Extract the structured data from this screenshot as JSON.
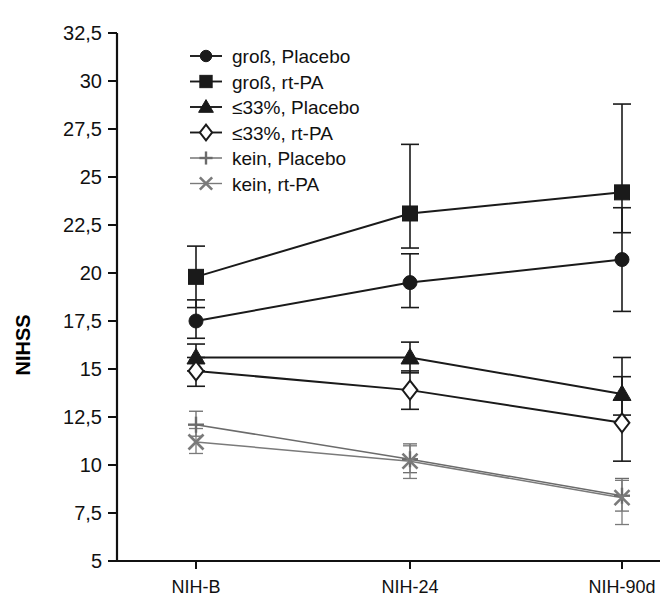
{
  "chart_data": {
    "type": "line",
    "title": "",
    "xlabel": "",
    "ylabel": "NIHSS",
    "categories": [
      "NIH-B",
      "NIH-24",
      "NIH-90d"
    ],
    "yticks": [
      "5",
      "7,5",
      "10",
      "12,5",
      "15",
      "17,5",
      "20",
      "22,5",
      "25",
      "27,5",
      "30",
      "32,5"
    ],
    "ytick_values": [
      5,
      7.5,
      10,
      12.5,
      15,
      17.5,
      20,
      22.5,
      25,
      27.5,
      30,
      32.5
    ],
    "ylim": [
      5,
      32.5
    ],
    "grid": false,
    "legend_position": "top-center-inside",
    "error_bars": "present",
    "series": [
      {
        "name": "groß, Placebo",
        "marker": "filled-circle",
        "color": "#1a1a1a",
        "values": [
          17.5,
          19.5,
          20.7
        ],
        "err_low": [
          16.6,
          18.2,
          18.0
        ],
        "err_high": [
          18.6,
          21.0,
          23.4
        ]
      },
      {
        "name": "groß, rt-PA",
        "marker": "filled-square",
        "color": "#1a1a1a",
        "values": [
          19.8,
          23.1,
          24.2
        ],
        "err_low": [
          18.2,
          21.3,
          22.1
        ],
        "err_high": [
          21.4,
          26.7,
          28.8
        ]
      },
      {
        "name": "≤33%, Placebo",
        "marker": "filled-triangle",
        "color": "#1a1a1a",
        "values": [
          15.6,
          15.6,
          13.7
        ],
        "err_low": [
          14.9,
          14.8,
          12.6
        ],
        "err_high": [
          16.3,
          16.4,
          15.6
        ]
      },
      {
        "name": "≤33%, rt-PA",
        "marker": "open-diamond",
        "color": "#1a1a1a",
        "values": [
          14.9,
          13.9,
          12.2
        ],
        "err_low": [
          14.1,
          12.9,
          10.2
        ],
        "err_high": [
          15.6,
          14.9,
          14.6
        ]
      },
      {
        "name": "kein, Placebo",
        "marker": "plus",
        "color": "#6b6b6b",
        "values": [
          12.1,
          10.3,
          8.4
        ],
        "err_low": [
          11.5,
          9.6,
          7.6
        ],
        "err_high": [
          12.8,
          11.1,
          9.3
        ]
      },
      {
        "name": "kein, rt-PA",
        "marker": "cross",
        "color": "#7a7a7a",
        "values": [
          11.2,
          10.2,
          8.3
        ],
        "err_low": [
          10.6,
          9.3,
          6.9
        ],
        "err_high": [
          11.9,
          11.0,
          9.2
        ]
      }
    ]
  },
  "legend": {
    "items": [
      {
        "label": "groß, Placebo"
      },
      {
        "label": "groß, rt-PA"
      },
      {
        "label": "≤33%, Placebo"
      },
      {
        "label": "≤33%, rt-PA"
      },
      {
        "label": "kein, Placebo"
      },
      {
        "label": "kein, rt-PA"
      }
    ]
  },
  "axes": {
    "y_title": "NIHSS",
    "y_labels": [
      "32,5",
      "30",
      "27,5",
      "25",
      "22,5",
      "20",
      "17,5",
      "15",
      "12,5",
      "10",
      "7,5",
      "5"
    ],
    "x_labels": [
      "NIH-B",
      "NIH-24",
      "NIH-90d"
    ]
  }
}
